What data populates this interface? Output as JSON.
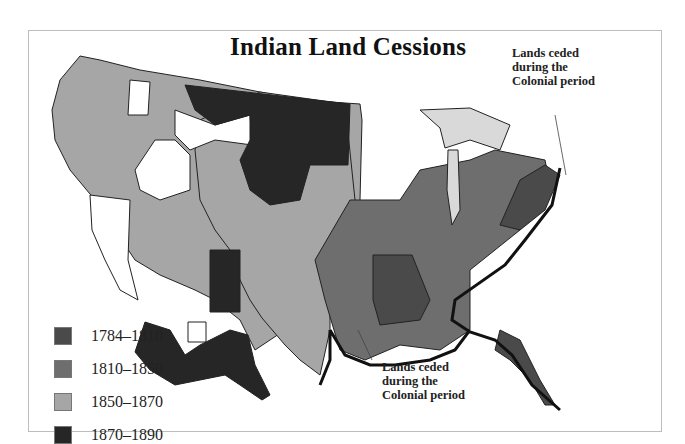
{
  "map": {
    "title": "Indian Land Cessions",
    "annotations": [
      {
        "id": "northeast",
        "lines": [
          "Lands ceded",
          "during the",
          "Colonial period"
        ]
      },
      {
        "id": "southeast",
        "lines": [
          "Lands ceded",
          "during the",
          "Colonial period"
        ]
      }
    ],
    "legend": [
      {
        "label": "1784–1810",
        "color": "#4a4a4a"
      },
      {
        "label": "1810–1850",
        "color": "#6e6e6e"
      },
      {
        "label": "1850–1870",
        "color": "#a6a6a6"
      },
      {
        "label": "1870–1890",
        "color": "#262626"
      }
    ],
    "colors": {
      "colonial": "#ffffff",
      "great_lakes": "#d9d9d9",
      "boundary": "#111111"
    }
  }
}
